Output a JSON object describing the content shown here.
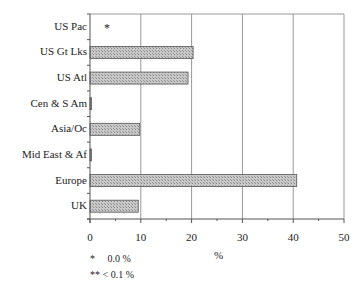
{
  "chart_data": {
    "type": "bar",
    "orientation": "horizontal",
    "title": "",
    "xlabel": "%",
    "ylabel": "",
    "xlim": [
      0,
      50
    ],
    "xticks": [
      "0",
      "10",
      "20",
      "30",
      "40",
      "50"
    ],
    "grid": true,
    "legend": null,
    "categories": [
      "US Pac",
      "US Gt Lks",
      "US Atl",
      "Cen & S Am",
      "Asia/Oc",
      "Mid East & Af",
      "Europe",
      "UK"
    ],
    "values": [
      0.0,
      20.3,
      19.3,
      0.3,
      9.8,
      0.3,
      40.7,
      9.5
    ],
    "annotations": [
      {
        "category": "US Pac",
        "text": "*"
      }
    ],
    "footnotes": [
      "*     0.0 %",
      "** < 0.1 %"
    ]
  },
  "colors": {
    "bar_fill": "#b8b8b8",
    "bar_edge": "#555555",
    "grid": "#999999",
    "axis": "#555555"
  }
}
